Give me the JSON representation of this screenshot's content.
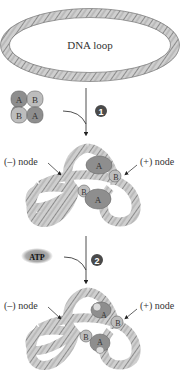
{
  "diagram": {
    "dna_loop_label": "DNA loop",
    "steps": [
      {
        "number": "1"
      },
      {
        "number": "2",
        "input": "ATP"
      }
    ],
    "complex_subunits": {
      "top_left": "A",
      "top_right": "B",
      "bottom_left": "B",
      "bottom_right": "A"
    },
    "stage2": {
      "left_label": "(–) node",
      "right_label": "(+) node",
      "subunit_labels": [
        "A",
        "B",
        "B",
        "A"
      ]
    },
    "stage3": {
      "left_label": "(–) node",
      "right_label": "(+) node",
      "subunit_labels": [
        "A",
        "B",
        "B",
        "A"
      ]
    }
  },
  "colors": {
    "dna_fill": "#c8c8c8",
    "dna_stripe": "#7a7a7a",
    "subunit_dark": "#8e8e8e",
    "subunit_light": "#bdbdbd",
    "step_marker": "#4a4a4a",
    "atp_bg": "#9a9a9a"
  }
}
